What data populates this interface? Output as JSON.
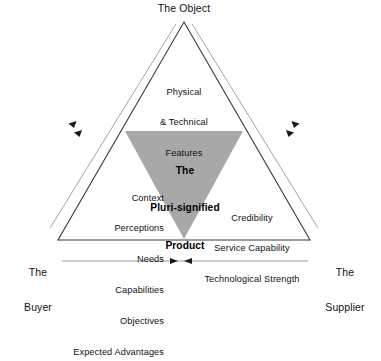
{
  "diagram": {
    "title_apex": "The Object",
    "corner_left": "The\nBuyer",
    "corner_left_line1": "The",
    "corner_left_line2": "Buyer",
    "corner_right_line1": "The",
    "corner_right_line2": "Supplier",
    "top_block": {
      "line1": "Physical",
      "line2": "& Technical",
      "line3": "Features"
    },
    "center_block": {
      "line1": "The",
      "line2": "Pluri-signified",
      "line3": "Product"
    },
    "left_block": {
      "line1": "Context",
      "line2": "Perceptions",
      "line3": "Needs",
      "line4": "Capabilities",
      "line5": "Objectives",
      "line6": "Expected Advantages"
    },
    "right_block": {
      "line1": "Credibility",
      "line2": "Service Capability",
      "line3": "Technological Strength"
    },
    "colors": {
      "inner_triangle_fill": "#a8a8a8",
      "outline": "#3a3a3a",
      "guide_line": "#9a9a9a",
      "text": "#111111",
      "background": "#ffffff"
    }
  }
}
